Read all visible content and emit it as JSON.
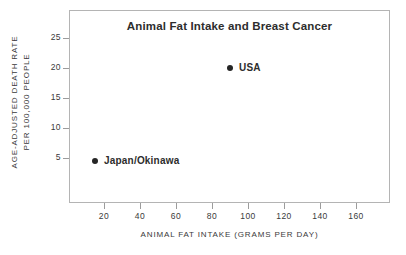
{
  "chart_data": {
    "type": "scatter",
    "title": "Animal Fat Intake and Breast Cancer",
    "xlabel": "ANIMAL FAT INTAKE (GRAMS PER DAY)",
    "ylabel_line1": "AGE-ADJUSTED DEATH RATE",
    "ylabel_line2": "PER 100,000 PEOPLE",
    "xlim": [
      0,
      178
    ],
    "ylim": [
      0,
      31
    ],
    "xticks": [
      20,
      40,
      60,
      80,
      100,
      120,
      140,
      160
    ],
    "xtick_labels": [
      "20",
      "40",
      "60",
      "80",
      "100",
      "120",
      "140",
      "160"
    ],
    "yticks": [
      5,
      10,
      15,
      20,
      25
    ],
    "ytick_labels": [
      "5",
      "10",
      "15",
      "20",
      "25"
    ],
    "grid": false,
    "legend": "none",
    "marker_color": "#252525",
    "frame_color": "#b4b4b4",
    "text_color": "#2d2d2d",
    "background": "#ffffff",
    "points": [
      {
        "label": "USA",
        "x": 90,
        "y": 20
      },
      {
        "label": "Japan/Okinawa",
        "x": 15,
        "y": 4.5
      }
    ]
  }
}
